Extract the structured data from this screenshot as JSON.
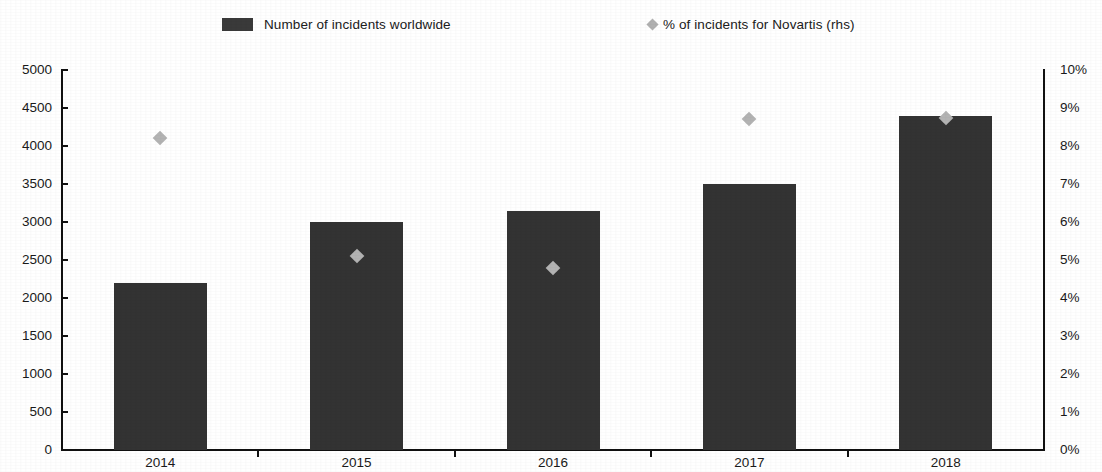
{
  "legend": {
    "entries": [
      {
        "label": "Number of incidents worldwide",
        "marker": "bar-swatch",
        "color": "#333333"
      },
      {
        "label": "% of incidents for Novartis (rhs)",
        "marker": "diamond-marker",
        "color": "#b3b3b3"
      }
    ]
  },
  "axes": {
    "left_ticks": [
      "5000",
      "4500",
      "4000",
      "3500",
      "3000",
      "2500",
      "2000",
      "1500",
      "1000",
      "500",
      "0"
    ],
    "right_ticks": [
      "10%",
      "9%",
      "8%",
      "7%",
      "6%",
      "5%",
      "4%",
      "3%",
      "2%",
      "1%",
      "0%"
    ],
    "x_ticks": [
      "2014",
      "2015",
      "2016",
      "2017",
      "2018"
    ]
  },
  "chart_data": {
    "type": "bar",
    "title": "",
    "subtitle": "",
    "xlabel": "",
    "ylabel": "",
    "y2label": "",
    "grid": false,
    "legend_position": "top",
    "categories": [
      "2014",
      "2015",
      "2016",
      "2017",
      "2018"
    ],
    "series": [
      {
        "name": "Number of incidents worldwide",
        "type": "bar",
        "axis": "left",
        "color": "#333333",
        "values": [
          2200,
          3000,
          3150,
          3500,
          4400
        ]
      },
      {
        "name": "% of incidents for Novartis (rhs)",
        "type": "scatter",
        "axis": "right",
        "color": "#b3b3b3",
        "marker": "diamond",
        "values": [
          8.2,
          5.1,
          4.8,
          8.7,
          8.75
        ]
      }
    ],
    "ylim": [
      0,
      5000
    ],
    "ytick_step": 500,
    "y2lim": [
      0,
      10
    ],
    "y2tick_step": 1,
    "y2_unit": "%"
  }
}
